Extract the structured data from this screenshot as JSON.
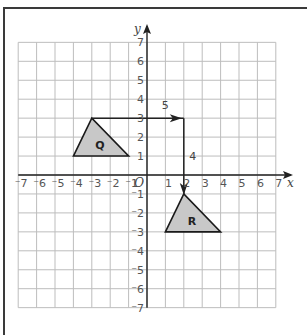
{
  "diagram": {
    "type": "coordinate-grid-translation",
    "axes": {
      "x_label": "x",
      "y_label": "y",
      "origin_label": "O",
      "x_range": [
        -7,
        7
      ],
      "y_range": [
        -7,
        7
      ],
      "x_ticks": [
        "-7",
        "-6",
        "-5",
        "-4",
        "-3",
        "-2",
        "-1",
        "1",
        "2",
        "3",
        "4",
        "5",
        "6",
        "7"
      ],
      "y_ticks": [
        "7",
        "6",
        "5",
        "4",
        "3",
        "2",
        "1",
        "-1",
        "-2",
        "-3",
        "-4",
        "-5",
        "-6",
        "-7"
      ]
    },
    "shapes": [
      {
        "label": "Q",
        "vertices": [
          [
            -4,
            1
          ],
          [
            -3,
            3
          ],
          [
            -1,
            1
          ]
        ],
        "fill": "#c8c8c8"
      },
      {
        "label": "R",
        "vertices": [
          [
            1,
            -3
          ],
          [
            2,
            -1
          ],
          [
            4,
            -3
          ]
        ],
        "fill": "#c8c8c8"
      }
    ],
    "translation": {
      "horizontal": {
        "from": [
          -3,
          3
        ],
        "to": [
          2,
          3
        ],
        "label": "5"
      },
      "vertical": {
        "from": [
          2,
          3
        ],
        "to": [
          2,
          -1
        ],
        "label": "4"
      }
    },
    "colors": {
      "grid": "#bdbdbd",
      "axis": "#222222",
      "frame": "#3a3a3a",
      "shape_fill": "#c8c8c8",
      "shape_stroke": "#1a1a1a"
    }
  }
}
